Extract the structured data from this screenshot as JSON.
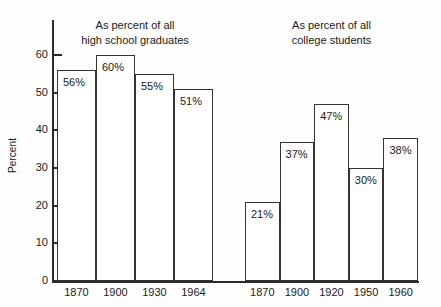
{
  "chart_data": {
    "type": "bar",
    "title": "",
    "xlabel": "",
    "ylabel": "Percent",
    "ylim": [
      0,
      65
    ],
    "ytick_values": [
      0,
      10,
      20,
      30,
      40,
      50,
      60
    ],
    "ytick_labels": [
      "0",
      "10",
      "20",
      "30",
      "40",
      "50",
      "60"
    ],
    "grid": false,
    "legend_position": "none",
    "groups": [
      {
        "name": "high-school-graduates",
        "annotation": "As percent of all\nhigh school graduates",
        "categories": [
          "1870",
          "1900",
          "1930",
          "1964"
        ],
        "values": [
          56,
          60,
          55,
          51
        ],
        "data_labels": [
          "56%",
          "60%",
          "55%",
          "51%"
        ]
      },
      {
        "name": "college-students",
        "annotation": "As percent of all\ncollege students",
        "categories": [
          "1870",
          "1900",
          "1920",
          "1950",
          "1960"
        ],
        "values": [
          21,
          37,
          47,
          30,
          38
        ],
        "data_labels": [
          "21%",
          "37%",
          "47%",
          "30%",
          "38%"
        ]
      }
    ],
    "colors": {
      "bar_fill": "#ffffff",
      "bar_stroke": "#333333",
      "axis": "#2b2b2b",
      "text": "#1a1a1a",
      "background": "#fefefe"
    }
  }
}
